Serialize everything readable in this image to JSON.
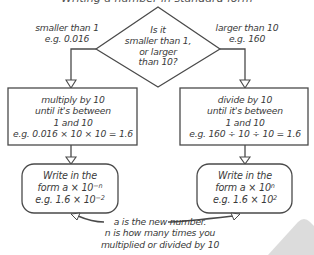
{
  "title_partial": "Writing a number in standard form",
  "decision": {
    "question_line1": "Is it",
    "question_line2": "smaller than 1,",
    "question_line3": "or larger",
    "question_line4": "than 10?"
  },
  "left_branch": {
    "label_line1": "smaller than 1",
    "label_line2": "e.g. 0.016",
    "process_line1": "multiply by 10",
    "process_line2": "until it's between",
    "process_line3": "1 and 10",
    "process_line4": "e.g. 0.016 × 10 × 10 = 1.6",
    "result_line1": "Write in the",
    "result_line2_base": "form a × 10",
    "result_line2_exp": "−n",
    "result_line3_base": "e.g. 1.6 × 10",
    "result_line3_exp": "−2"
  },
  "right_branch": {
    "label_line1": "larger than 10",
    "label_line2": "e.g. 160",
    "process_line1": "divide by 10",
    "process_line2": "until it's between",
    "process_line3": "1 and 10",
    "process_line4": "e.g. 160 ÷ 10 ÷ 10 = 1.6",
    "result_line1": "Write in the",
    "result_line2_base": "form a × 10",
    "result_line2_exp": "n",
    "result_line3_base": "e.g. 1.6 × 10",
    "result_line3_exp": "2"
  },
  "note": {
    "line1": "a is the new number.",
    "line2": "n is how many times you",
    "line3": "multiplied or divided by 10"
  },
  "colors": {
    "stroke": "#4a4a4a",
    "text": "#3a3a3a",
    "corner_shape": "#d9d9d9"
  }
}
